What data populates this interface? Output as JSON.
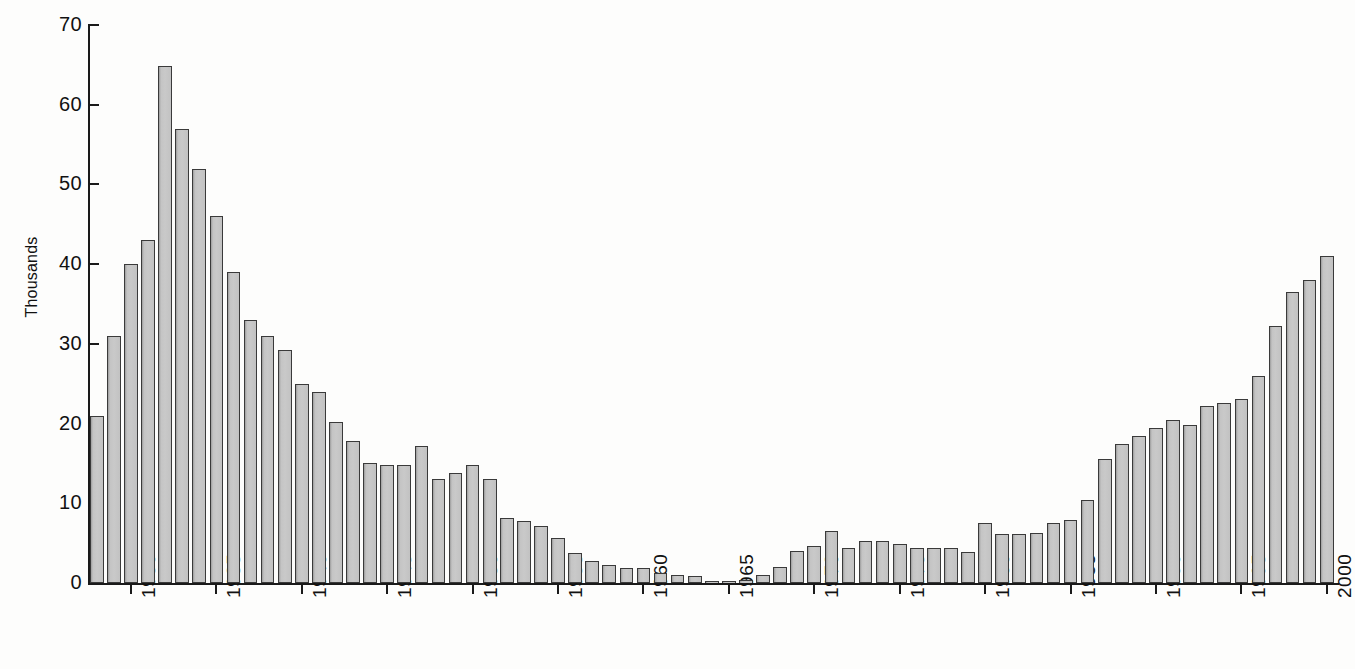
{
  "chart_data": {
    "type": "bar",
    "title": "",
    "subtitle": "",
    "xlabel": "",
    "ylabel": "Thousands",
    "ylim": [
      0,
      70
    ],
    "ytick_labels": [
      "0",
      "10",
      "20",
      "30",
      "40",
      "50",
      "60",
      "70"
    ],
    "ytick_values": [
      0,
      10,
      20,
      30,
      40,
      50,
      60,
      70
    ],
    "xtick_labels": [
      "1930",
      "1935",
      "1940",
      "1945",
      "1950",
      "1955",
      "1960",
      "1965",
      "1970",
      "1975",
      "1980",
      "1985",
      "1990",
      "1995",
      "2000"
    ],
    "xtick_values": [
      1930,
      1935,
      1940,
      1945,
      1950,
      1955,
      1960,
      1965,
      1970,
      1975,
      1980,
      1985,
      1990,
      1995,
      2000
    ],
    "grid": false,
    "legend": "none",
    "x_range": [
      1928,
      2000
    ],
    "categories": [
      1928,
      1929,
      1930,
      1931,
      1932,
      1933,
      1934,
      1935,
      1936,
      1937,
      1938,
      1939,
      1940,
      1941,
      1942,
      1943,
      1944,
      1945,
      1946,
      1947,
      1948,
      1949,
      1950,
      1951,
      1952,
      1953,
      1954,
      1955,
      1956,
      1957,
      1958,
      1959,
      1960,
      1961,
      1962,
      1963,
      1964,
      1965,
      1966,
      1967,
      1968,
      1969,
      1970,
      1971,
      1972,
      1973,
      1974,
      1975,
      1976,
      1977,
      1978,
      1979,
      1980,
      1981,
      1982,
      1983,
      1984,
      1985,
      1986,
      1987,
      1988,
      1989,
      1990,
      1991,
      1992,
      1993,
      1994,
      1995,
      1996,
      1997,
      1998,
      1999,
      2000
    ],
    "values": [
      21.0,
      31.0,
      40.0,
      43.0,
      64.8,
      57.0,
      52.0,
      46.0,
      39.0,
      33.0,
      31.0,
      29.2,
      25.0,
      24.0,
      20.2,
      17.8,
      15.0,
      14.8,
      14.8,
      17.2,
      13.0,
      13.8,
      14.8,
      13.0,
      8.1,
      7.8,
      7.1,
      5.7,
      3.8,
      2.7,
      2.2,
      1.9,
      1.9,
      1.2,
      1.0,
      0.9,
      0.2,
      0.3,
      0.4,
      1.0,
      2.0,
      4.0,
      4.7,
      6.5,
      4.4,
      5.3,
      5.3,
      4.9,
      4.4,
      4.4,
      4.4,
      3.9,
      7.5,
      6.1,
      6.1,
      6.3,
      7.5,
      7.9,
      10.4,
      15.5,
      17.5,
      18.5,
      19.4,
      20.4,
      19.8,
      22.2,
      22.6,
      23.1,
      26.0,
      32.2,
      36.5,
      38.0,
      41.0
    ],
    "series_name": "Thousands",
    "colors": {
      "bar_fill": "#c7c7c7",
      "bar_edge": "#3a3a3a",
      "axis": "#1a1a1a",
      "text": "#111111",
      "background": "#fdfdfc"
    }
  }
}
